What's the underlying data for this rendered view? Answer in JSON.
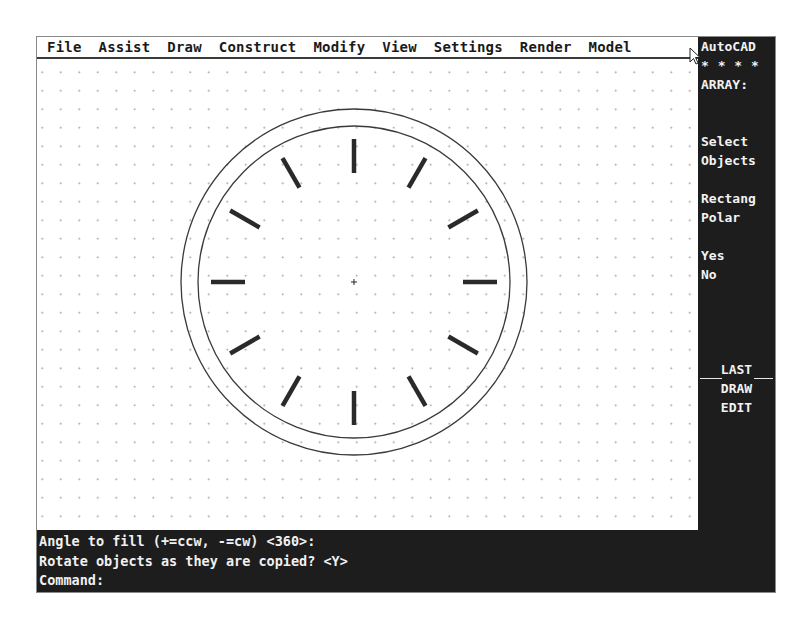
{
  "app": {
    "name": "AutoCAD"
  },
  "menubar": {
    "items": [
      {
        "label": "File"
      },
      {
        "label": "Assist"
      },
      {
        "label": "Draw"
      },
      {
        "label": "Construct"
      },
      {
        "label": "Modify"
      },
      {
        "label": "View"
      },
      {
        "label": "Settings"
      },
      {
        "label": "Render"
      },
      {
        "label": "Model"
      }
    ]
  },
  "side_menu": {
    "title": "AutoCAD",
    "stars": "* * * *",
    "command": "ARRAY:",
    "items": [
      {
        "label": "Select"
      },
      {
        "label": "Objects"
      },
      {
        "label": "Rectang"
      },
      {
        "label": "Polar"
      },
      {
        "label": "Yes"
      },
      {
        "label": "No"
      }
    ],
    "footer": [
      {
        "label": "LAST"
      },
      {
        "label": "DRAW"
      },
      {
        "label": "EDIT"
      }
    ]
  },
  "drawing": {
    "center": {
      "x": 317,
      "y": 223
    },
    "outer_radius": 173,
    "inner_radius": 156,
    "tick_count": 12,
    "tick_inner_radius": 109,
    "tick_outer_radius": 143,
    "tick_angle_step_deg": 30
  },
  "command_line": {
    "lines": [
      "Angle to fill (+=ccw, -=cw) <360>:",
      "Rotate objects as they are copied? <Y>",
      "Command:"
    ]
  },
  "colors": {
    "screen_dark": "#1d1d1d",
    "drawing_bg": "#ffffff",
    "text_light": "#f2f2f2",
    "geometry": "#2a2a2a"
  }
}
